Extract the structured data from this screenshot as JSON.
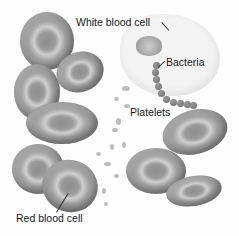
{
  "figure": {
    "type": "illustration",
    "palette": "grayscale",
    "labels": {
      "white_blood_cell": "White blood cell",
      "bacteria": "Bacteria",
      "platelets": "Platelets",
      "red_blood_cell": "Red blood cell"
    }
  }
}
